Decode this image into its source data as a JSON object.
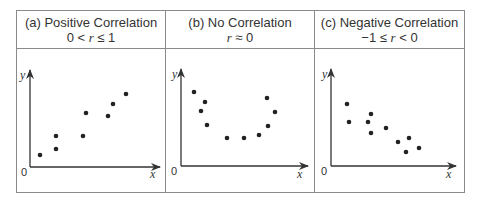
{
  "panels": [
    {
      "title": "(a) Positive Correlation",
      "formula_parts": [
        "0 < ",
        "r",
        " ≤ 1"
      ],
      "x_label": "x",
      "y_label": "y",
      "origin_label": "0",
      "points": [
        [
          40,
          155
        ],
        [
          56,
          149
        ],
        [
          56,
          136
        ],
        [
          83,
          136
        ],
        [
          86,
          113
        ],
        [
          108,
          116
        ],
        [
          113,
          104
        ],
        [
          126,
          94
        ]
      ]
    },
    {
      "title": "(b) No Correlation",
      "formula_parts": [
        "",
        "r",
        " ≈ 0"
      ],
      "x_label": "x",
      "y_label": "y",
      "origin_label": "0",
      "points": [
        [
          194,
          92
        ],
        [
          205,
          102
        ],
        [
          201,
          111
        ],
        [
          207,
          125
        ],
        [
          227,
          138
        ],
        [
          244,
          138
        ],
        [
          259,
          135
        ],
        [
          267,
          98
        ],
        [
          275,
          112
        ],
        [
          268,
          126
        ]
      ]
    },
    {
      "title": "(c) Negative Correlation",
      "formula_parts": [
        "−1 ≤ ",
        "r",
        " < 0"
      ],
      "x_label": "x",
      "y_label": "y",
      "origin_label": "0",
      "points": [
        [
          347,
          104
        ],
        [
          349,
          122
        ],
        [
          371,
          114
        ],
        [
          368,
          122
        ],
        [
          371,
          133
        ],
        [
          386,
          128
        ],
        [
          398,
          142
        ],
        [
          409,
          138
        ],
        [
          406,
          152
        ],
        [
          419,
          148
        ]
      ]
    }
  ],
  "colors": {
    "border": "#8a8a8a",
    "axis": "#333333",
    "dot": "#222222"
  }
}
